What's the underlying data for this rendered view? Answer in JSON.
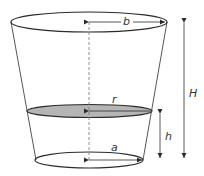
{
  "diagram": {
    "type": "frustum-cross-section",
    "labels": {
      "top_radius": "b",
      "section_radius": "r",
      "bottom_radius": "a",
      "section_height": "h",
      "total_height": "H"
    },
    "colors": {
      "stroke": "#2b2b2b",
      "section_fill": "#b5b5b5",
      "axis": "#777777",
      "background": "#ffffff"
    }
  }
}
